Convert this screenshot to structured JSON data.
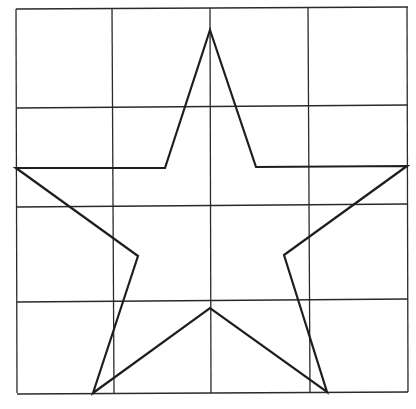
{
  "diagram": {
    "type": "star-on-grid",
    "width": 416,
    "height": 409,
    "colors": {
      "background": "#ffffff",
      "grid": "#2a2a2a",
      "star": "#1e1e1e"
    },
    "grid": {
      "rows": 4,
      "cols": 4,
      "vertical_lines": [
        {
          "x1": 16,
          "y1": 9,
          "x2": 17,
          "y2": 393
        },
        {
          "x1": 112,
          "y1": 8,
          "x2": 114,
          "y2": 393
        },
        {
          "x1": 210,
          "y1": 8,
          "x2": 211,
          "y2": 393
        },
        {
          "x1": 308,
          "y1": 7,
          "x2": 310,
          "y2": 392
        },
        {
          "x1": 407,
          "y1": 7,
          "x2": 408,
          "y2": 392
        }
      ],
      "horizontal_lines": [
        {
          "x1": 16,
          "y1": 9,
          "x2": 408,
          "y2": 7
        },
        {
          "x1": 16,
          "y1": 108,
          "x2": 408,
          "y2": 105
        },
        {
          "x1": 17,
          "y1": 207,
          "x2": 408,
          "y2": 204
        },
        {
          "x1": 17,
          "y1": 302,
          "x2": 408,
          "y2": 299
        },
        {
          "x1": 17,
          "y1": 394,
          "x2": 408,
          "y2": 392
        }
      ]
    },
    "star": {
      "points": [
        [
          210,
          30
        ],
        [
          256,
          167
        ],
        [
          407,
          166
        ],
        [
          284,
          255
        ],
        [
          327,
          392
        ],
        [
          210,
          308
        ],
        [
          93,
          393
        ],
        [
          138,
          256
        ],
        [
          16,
          168
        ],
        [
          165,
          168
        ]
      ]
    }
  }
}
